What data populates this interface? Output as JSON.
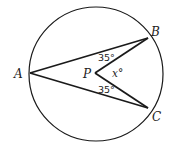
{
  "diagram": {
    "type": "circle-geometry",
    "points": {
      "A": {
        "label": "A"
      },
      "B": {
        "label": "B"
      },
      "C": {
        "label": "C"
      },
      "P": {
        "label": "P"
      }
    },
    "angles": {
      "ABP": "35°",
      "ACP": "35°",
      "BPC": "x°"
    },
    "colors": {
      "stroke": "#1a1a1a",
      "background": "#ffffff"
    }
  }
}
